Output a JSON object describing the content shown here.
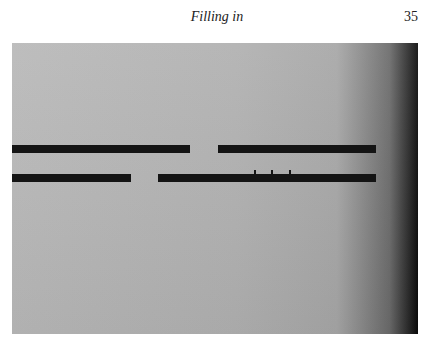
{
  "header": {
    "title": "Filling in",
    "page_number": "35"
  },
  "figure": {
    "rows": [
      {
        "bars": [
          {
            "x": 0,
            "w": 178
          },
          {
            "x": 206,
            "w": 158
          }
        ],
        "y": 102
      },
      {
        "bars": [
          {
            "x": 0,
            "w": 119
          },
          {
            "x": 146,
            "w": 218
          }
        ],
        "y": 131,
        "ticks": [
          242,
          259,
          277
        ]
      }
    ]
  }
}
